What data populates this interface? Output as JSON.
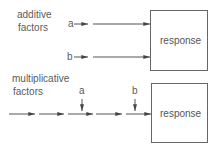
{
  "additive": {
    "label_line1": "additive",
    "label_line2": "factors",
    "inputs": [
      {
        "label": "a"
      },
      {
        "label": "b"
      }
    ],
    "box_label": "response"
  },
  "multiplicative": {
    "label_line1": "multiplicative",
    "label_line2": "factors",
    "inputs": [
      {
        "label": "a"
      },
      {
        "label": "b"
      }
    ],
    "box_label": "response"
  },
  "colors": {
    "stroke": "#555555",
    "text": "#5a5a5a",
    "background": "#ffffff"
  }
}
